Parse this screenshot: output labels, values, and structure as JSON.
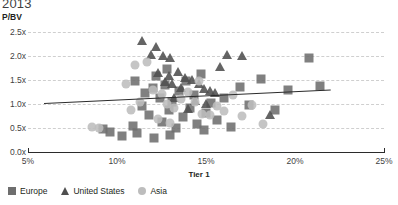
{
  "chart_data": {
    "type": "scatter",
    "title": "2013",
    "xlabel": "Tier 1",
    "ylabel": "P/BV",
    "xlim": [
      5,
      25
    ],
    "ylim": [
      0.0,
      2.5
    ],
    "xticks": [
      "5%",
      "10%",
      "15%",
      "20%",
      "25%"
    ],
    "xtick_values": [
      5,
      10,
      15,
      20,
      25
    ],
    "yticks": [
      "0.0x",
      "0.5x",
      "1.0x",
      "1.5x",
      "2.0x",
      "2.5x"
    ],
    "ytick_values": [
      0.0,
      0.5,
      1.0,
      1.5,
      2.0,
      2.5
    ],
    "grid": true,
    "legend_position": "bottom-left",
    "colors": {
      "europe": "#6e6e6e",
      "united_states": "#4f4f4f",
      "asia": "#bdbdbd",
      "grid": "#cfcfcf",
      "axis": "#2b2b2b",
      "trendline": "#2b2b2b",
      "title": "#3f3f3f"
    },
    "series": [
      {
        "name": "Europe",
        "marker": "square",
        "color": "#6e6e6e",
        "points": [
          [
            9.2,
            0.48
          ],
          [
            9.6,
            0.42
          ],
          [
            10.3,
            0.33
          ],
          [
            10.9,
            0.55
          ],
          [
            11.1,
            0.4
          ],
          [
            11.4,
            0.95
          ],
          [
            11.6,
            1.22
          ],
          [
            11.8,
            0.78
          ],
          [
            12.0,
            1.33
          ],
          [
            12.2,
            1.58
          ],
          [
            12.4,
            1.12
          ],
          [
            12.5,
            0.62
          ],
          [
            12.7,
            1.4
          ],
          [
            12.9,
            0.88
          ],
          [
            13.1,
            1.05
          ],
          [
            13.3,
            0.5
          ],
          [
            13.5,
            1.28
          ],
          [
            13.7,
            0.72
          ],
          [
            13.9,
            1.48
          ],
          [
            14.1,
            0.92
          ],
          [
            14.3,
            1.18
          ],
          [
            14.5,
            0.58
          ],
          [
            14.7,
            1.62
          ],
          [
            15.0,
            0.82
          ],
          [
            15.3,
            1.02
          ],
          [
            15.6,
            0.66
          ],
          [
            16.0,
            1.12
          ],
          [
            16.4,
            0.52
          ],
          [
            16.9,
            1.35
          ],
          [
            17.4,
            0.97
          ],
          [
            18.1,
            1.52
          ],
          [
            18.9,
            0.88
          ],
          [
            19.6,
            1.3
          ],
          [
            20.8,
            1.95
          ],
          [
            21.4,
            1.38
          ],
          [
            12.1,
            0.3
          ],
          [
            13.0,
            0.35
          ],
          [
            14.9,
            0.45
          ],
          [
            11.0,
            1.48
          ],
          [
            12.8,
            1.72
          ]
        ]
      },
      {
        "name": "United States",
        "marker": "triangle",
        "color": "#4f4f4f",
        "points": [
          [
            11.4,
            2.28
          ],
          [
            12.2,
            2.15
          ],
          [
            11.9,
            1.98
          ],
          [
            12.6,
            1.95
          ],
          [
            13.0,
            1.92
          ],
          [
            12.3,
            1.6
          ],
          [
            12.9,
            1.55
          ],
          [
            13.4,
            1.62
          ],
          [
            13.8,
            1.5
          ],
          [
            14.2,
            1.45
          ],
          [
            14.6,
            1.38
          ],
          [
            14.9,
            1.28
          ],
          [
            15.2,
            1.22
          ],
          [
            15.5,
            1.18
          ],
          [
            13.6,
            1.3
          ],
          [
            13.2,
            1.08
          ],
          [
            14.4,
            1.02
          ],
          [
            15.0,
            0.95
          ],
          [
            15.8,
            1.72
          ],
          [
            16.2,
            1.98
          ],
          [
            17.0,
            1.95
          ],
          [
            18.6,
            0.72
          ],
          [
            14.0,
            0.85
          ],
          [
            13.1,
            1.38
          ],
          [
            12.7,
            1.42
          ]
        ]
      },
      {
        "name": "Asia",
        "marker": "circle",
        "color": "#bdbdbd",
        "points": [
          [
            8.6,
            0.52
          ],
          [
            9.0,
            0.5
          ],
          [
            10.5,
            1.42
          ],
          [
            11.0,
            1.82
          ],
          [
            11.7,
            1.88
          ],
          [
            12.0,
            1.3
          ],
          [
            12.5,
            1.2
          ],
          [
            12.8,
            1.0
          ],
          [
            13.2,
            0.92
          ],
          [
            13.6,
            1.1
          ],
          [
            14.0,
            1.25
          ],
          [
            14.4,
            1.05
          ],
          [
            14.8,
            0.8
          ],
          [
            15.2,
            0.78
          ],
          [
            15.6,
            0.95
          ],
          [
            16.0,
            0.85
          ],
          [
            16.5,
            1.18
          ],
          [
            17.0,
            0.75
          ],
          [
            17.6,
            0.98
          ],
          [
            18.2,
            0.58
          ],
          [
            12.3,
            0.68
          ],
          [
            13.0,
            0.6
          ],
          [
            11.3,
            1.05
          ],
          [
            10.8,
            0.88
          ],
          [
            14.6,
            1.48
          ]
        ]
      }
    ],
    "trendline": {
      "x1": 5.9,
      "y1": 1.02,
      "x2": 22.0,
      "y2": 1.3
    }
  },
  "legend": {
    "items": [
      {
        "label": "Europe",
        "marker": "square"
      },
      {
        "label": "United States",
        "marker": "triangle"
      },
      {
        "label": "Asia",
        "marker": "circle"
      }
    ]
  }
}
